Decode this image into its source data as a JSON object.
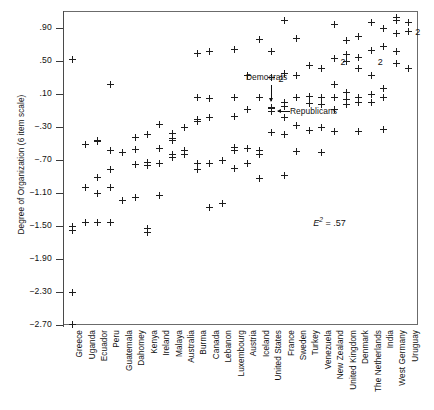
{
  "figure": {
    "ylabel": "Degree of Organization (6 item scale)",
    "annotations": {
      "democrats": "Democrats",
      "republicans": "Republicans",
      "e2_prefix": "E",
      "e2_exponent": "2",
      "e2_value": "= .57"
    }
  },
  "chart_data": {
    "type": "scatter",
    "title": "",
    "xlabel": "",
    "ylabel": "Degree of Organization (6 item scale)",
    "ylim": [
      -2.7,
      1.1
    ],
    "ytick_values": [
      0.9,
      0.5,
      0.1,
      -0.3,
      -0.7,
      -1.1,
      -1.5,
      -1.9,
      -2.3,
      -2.7
    ],
    "ytick_labels": [
      ".90",
      ".50",
      ".10",
      "−.30",
      "−.70",
      "−1.10",
      "−1.50",
      "−1.90",
      "−2.30",
      "−2.70"
    ],
    "grid": false,
    "legend": "none",
    "marker": "plus",
    "annotations": [
      {
        "text": "Democrats",
        "x": 21.0,
        "y": 0.33,
        "arrow": "down"
      },
      {
        "text": "Republicans",
        "x": 21.9,
        "y": 0.02,
        "arrow": "left"
      },
      {
        "text": "E2 = .57",
        "x": 25.4,
        "y": -1.46,
        "arrow": "none"
      }
    ],
    "categories": [
      "Greece",
      "Uganda",
      "Ecuador",
      "Peru",
      "Guatemala",
      "Dahomey",
      "Kenya",
      "Ireland",
      "Malaya",
      "Australia",
      "Burma",
      "Canada",
      "Lebanon",
      "Luxembourg",
      "Austria",
      "Iceland",
      "United States",
      "France",
      "Sweden",
      "Turkey",
      "Venezuela",
      "New Zealand",
      "United Kingdom",
      "Denmark",
      "The Netherlands",
      "India",
      "West Germany",
      "Uruguay"
    ],
    "series": [
      {
        "name": "observations",
        "points": [
          {
            "category": "Greece",
            "values": [
              0.53,
              -1.5,
              -1.55,
              -2.3,
              -2.68
            ]
          },
          {
            "category": "Uganda",
            "values": [
              -0.5,
              -1.02,
              -1.45
            ]
          },
          {
            "category": "Ecuador",
            "values": [
              -0.45,
              -0.47,
              -0.9,
              -1.1,
              -1.45
            ]
          },
          {
            "category": "Peru",
            "values": [
              0.22,
              -0.58,
              -0.8,
              -1.02,
              -1.45
            ]
          },
          {
            "category": "Guatemala",
            "values": [
              -0.6,
              -1.18
            ]
          },
          {
            "category": "Dahomey",
            "values": [
              -0.42,
              -0.57,
              -0.74,
              -1.15
            ]
          },
          {
            "category": "Kenya",
            "values": [
              -0.38,
              -0.72,
              -0.76,
              -1.52,
              -1.57
            ]
          },
          {
            "category": "Ireland",
            "values": [
              -0.26,
              -0.55,
              -0.73,
              -1.12
            ]
          },
          {
            "category": "Malaya",
            "values": [
              -0.37,
              -0.43,
              -0.46,
              -0.62,
              -0.66
            ]
          },
          {
            "category": "Australia",
            "values": [
              -0.3,
              -0.58,
              -0.62
            ]
          },
          {
            "category": "Burma",
            "values": [
              0.6,
              0.06,
              -0.2,
              -0.22,
              -0.73,
              -0.8
            ]
          },
          {
            "category": "Canada",
            "values": [
              0.62,
              0.05,
              -0.18,
              -0.73,
              -1.26
            ]
          },
          {
            "category": "Lebanon",
            "values": [
              -0.7,
              -1.22
            ]
          },
          {
            "category": "Luxembourg",
            "values": [
              0.65,
              0.06,
              -0.17,
              -0.54,
              -0.58,
              -0.79
            ]
          },
          {
            "category": "Austria",
            "values": [
              0.33,
              -0.08,
              -0.55,
              -0.73
            ]
          },
          {
            "category": "Iceland",
            "values": [
              0.77,
              0.06,
              -0.58,
              -0.62,
              -0.92
            ]
          },
          {
            "category": "United States",
            "values": [
              0.62,
              0.31,
              -0.05,
              -0.07,
              -0.1,
              -0.36
            ]
          },
          {
            "category": "France",
            "values": [
              1.0,
              0.36,
              0.01,
              -0.04,
              -0.18,
              -0.38,
              -0.88
            ]
          },
          {
            "category": "Sweden",
            "values": [
              0.78,
              0.33,
              0.07,
              -0.27,
              -0.59
            ]
          },
          {
            "category": "Turkey",
            "values": [
              0.45,
              0.08,
              -0.01,
              -0.33
            ]
          },
          {
            "category": "Venezuela",
            "values": [
              0.42,
              0.06,
              -0.02,
              -0.3,
              -0.6
            ]
          },
          {
            "category": "New Zealand",
            "values": [
              0.95,
              0.54,
              0.22,
              0.06,
              -0.08,
              -0.35
            ]
          },
          {
            "category": "United Kingdom",
            "values": [
              0.76,
              0.58,
              0.5,
              0.12,
              0.04,
              -0.02
            ]
          },
          {
            "category": "Denmark",
            "values": [
              0.8,
              0.55,
              0.42,
              0.06,
              0.0,
              -0.35
            ]
          },
          {
            "category": "The Netherlands",
            "values": [
              0.97,
              0.63,
              0.33,
              0.1,
              0.01
            ]
          },
          {
            "category": "India",
            "values": [
              0.9,
              0.68,
              0.17,
              0.06,
              -0.32
            ]
          },
          {
            "category": "West Germany",
            "values": [
              1.03,
              1.0,
              0.84,
              0.62,
              0.48
            ]
          },
          {
            "category": "Uruguay",
            "values": [
              0.97,
              0.86,
              0.42
            ]
          }
        ]
      }
    ],
    "overlap_labels": [
      {
        "text": "2",
        "category": "United States",
        "y": 0.29
      },
      {
        "text": "2",
        "category": "New Zealand",
        "y": 0.5
      },
      {
        "text": "2",
        "category": "The Netherlands",
        "y": 0.5
      },
      {
        "text": "2",
        "category": "Uruguay",
        "y": 0.86
      }
    ]
  }
}
